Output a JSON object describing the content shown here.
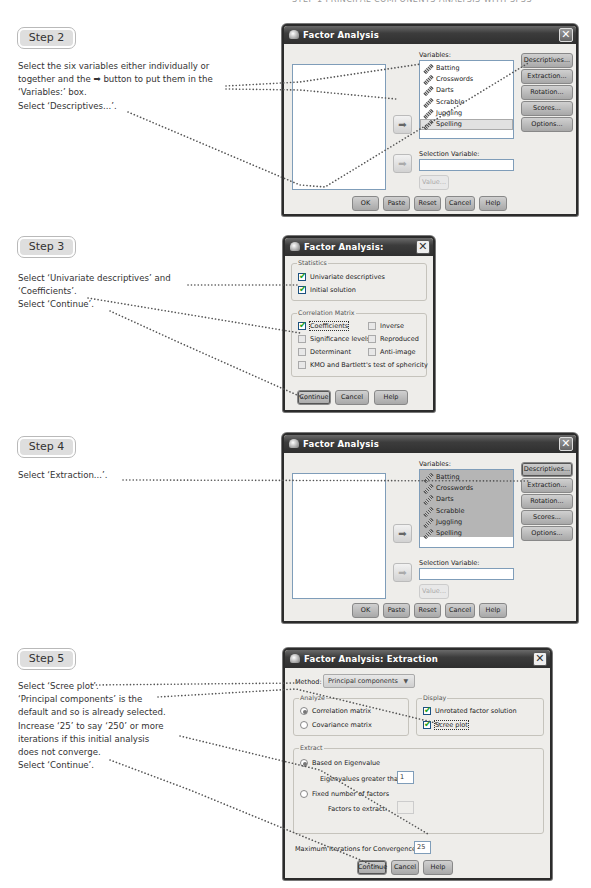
{
  "running_head": "STEP 1 PRINCIPAL COMPONENTS ANALYSIS WITH SPSS",
  "steps": [
    {
      "badge": "Step 2",
      "lines": [
        "Select the six variables either individually or",
        "together and the ➡ button to put them in the",
        "‘Variables:’ box.",
        "Select ‘Descriptives...’."
      ]
    },
    {
      "badge": "Step 3",
      "lines": [
        "Select ‘Univariate descriptives’ and",
        "‘Coefficients’.",
        "Select ‘Continue’."
      ]
    },
    {
      "badge": "Step 4",
      "lines": [
        "Select ‘Extraction...’."
      ]
    },
    {
      "badge": "Step 5",
      "lines": [
        "Select ‘Scree plot’.",
        "‘Principal components’ is the",
        "default and so is already selected.",
        "Increase ‘25’ to say ‘250’ or more",
        "iterations if this initial analysis",
        "does not converge.",
        "Select ‘Continue’."
      ]
    }
  ],
  "factor_dialog": {
    "title": "Factor Analysis",
    "close": "✕",
    "variables_label": "Variables:",
    "variables": [
      "Batting",
      "Crosswords",
      "Darts",
      "Scrabble",
      "Juggling",
      "Spelling"
    ],
    "move_arrow": "➡",
    "selection_variable_label": "Selection Variable:",
    "selection_variable_value": "",
    "value_button": "Value...",
    "side_buttons": [
      "Descriptives...",
      "Extraction...",
      "Rotation...",
      "Scores...",
      "Options..."
    ],
    "bottom_buttons": [
      "OK",
      "Paste",
      "Reset",
      "Cancel",
      "Help"
    ]
  },
  "descriptives_dialog": {
    "title": "Factor Analysis: Descriptives",
    "close": "✕",
    "statistics_group": "Statistics",
    "statistics": [
      {
        "label": "Univariate descriptives",
        "checked": true
      },
      {
        "label": "Initial solution",
        "checked": true
      }
    ],
    "correlation_group": "Correlation Matrix",
    "correlation_options": [
      {
        "label": "Coefficients",
        "checked": true
      },
      {
        "label": "Inverse",
        "checked": false
      },
      {
        "label": "Significance levels",
        "checked": false
      },
      {
        "label": "Reproduced",
        "checked": false
      },
      {
        "label": "Determinant",
        "checked": false
      },
      {
        "label": "Anti-image",
        "checked": false
      },
      {
        "label": "KMO and Bartlett's test of sphericity",
        "checked": false
      }
    ],
    "buttons": [
      "Continue",
      "Cancel",
      "Help"
    ]
  },
  "extraction_dialog": {
    "title": "Factor Analysis: Extraction",
    "close": "✕",
    "method_label": "Method:",
    "method_value": "Principal components",
    "analyze_group": "Analyze",
    "analyze_options": [
      {
        "label": "Correlation matrix",
        "selected": true
      },
      {
        "label": "Covariance matrix",
        "selected": false
      }
    ],
    "display_group": "Display",
    "display_options": [
      {
        "label": "Unrotated factor solution",
        "checked": true
      },
      {
        "label": "Scree plot",
        "checked": true
      }
    ],
    "extract_group": "Extract",
    "extract_options": [
      {
        "label": "Based on Eigenvalue",
        "selected": true
      },
      {
        "label": "Fixed number of factors",
        "selected": false
      }
    ],
    "eigenvalues_label": "Eigenvalues greater than:",
    "eigenvalues_value": "1",
    "factors_label": "Factors to extract:",
    "factors_value": "",
    "max_iter_label": "Maximum Iterations for Convergence:",
    "max_iter_value": "25",
    "buttons": [
      "Continue",
      "Cancel",
      "Help"
    ]
  }
}
